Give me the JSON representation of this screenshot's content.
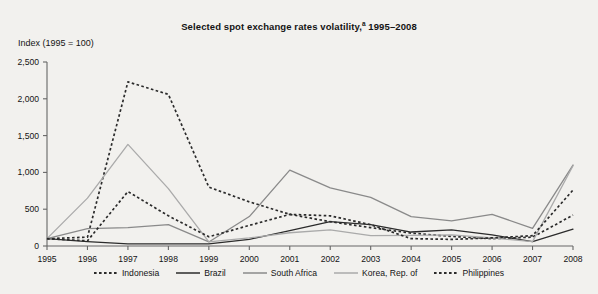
{
  "chart_data": {
    "type": "line",
    "title": "Selected spot exchange rates volatility,a 1995–2008",
    "title_main": "Selected spot exchange rates volatility,",
    "title_footnote_marker": "a",
    "title_years": " 1995–2008",
    "ylabel": "Index (1995 = 100)",
    "xlabel": "",
    "ylim": [
      0,
      2500
    ],
    "ytick_values": [
      0,
      500,
      1000,
      1500,
      2000,
      2500
    ],
    "ytick_labels": [
      "0",
      "500",
      "1,000",
      "1,500",
      "2,000",
      "2,500"
    ],
    "grid": false,
    "legend_position": "bottom",
    "x": [
      1995,
      1996,
      1997,
      1998,
      1999,
      2000,
      2001,
      2002,
      2003,
      2004,
      2005,
      2006,
      2007,
      2008
    ],
    "categories": [
      "1995",
      "1996",
      "1997",
      "1998",
      "1999",
      "2000",
      "2001",
      "2002",
      "2003",
      "2004",
      "2005",
      "2006",
      "2007",
      "2008"
    ],
    "series": [
      {
        "name": "Indonesia",
        "style": "dotted",
        "color": "#2b2b2b",
        "values": [
          100,
          120,
          2230,
          2060,
          800,
          600,
          430,
          330,
          250,
          175,
          130,
          100,
          120,
          420
        ]
      },
      {
        "name": "Brazil",
        "style": "solid",
        "color": "#2b2b2b",
        "values": [
          100,
          60,
          30,
          30,
          30,
          90,
          210,
          330,
          290,
          190,
          220,
          150,
          60,
          230
        ]
      },
      {
        "name": "South Africa",
        "style": "solid",
        "color": "#8a8a8a",
        "values": [
          100,
          235,
          250,
          290,
          55,
          400,
          1030,
          790,
          660,
          400,
          340,
          430,
          240,
          1100
        ]
      },
      {
        "name": "Korea, Rep. of",
        "style": "solid",
        "color": "#aaaaaa",
        "values": [
          100,
          650,
          1380,
          780,
          55,
          110,
          180,
          220,
          140,
          145,
          150,
          110,
          60,
          1090
        ]
      },
      {
        "name": "Philippines",
        "style": "dotted",
        "color": "#2b2b2b",
        "values": [
          100,
          70,
          740,
          410,
          125,
          280,
          430,
          410,
          290,
          100,
          90,
          110,
          140,
          760
        ]
      }
    ]
  },
  "legend": {
    "items": [
      {
        "label": "Indonesia",
        "style": "dotted",
        "color": "#2b2b2b"
      },
      {
        "label": "Brazil",
        "style": "solid",
        "color": "#2b2b2b"
      },
      {
        "label": "South Africa",
        "style": "solid",
        "color": "#8a8a8a"
      },
      {
        "label": "Korea, Rep. of",
        "style": "solid",
        "color": "#aaaaaa"
      },
      {
        "label": "Philippines",
        "style": "dotted",
        "color": "#2b2b2b"
      }
    ]
  },
  "axes": {
    "axis_color": "#666666",
    "background": "#f2f1ee"
  }
}
